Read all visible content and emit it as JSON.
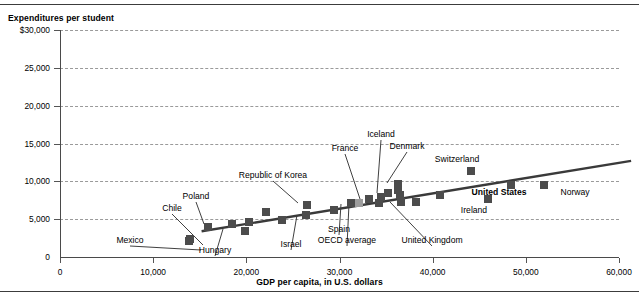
{
  "chart_data": {
    "type": "scatter",
    "title": "",
    "ylabel": "Expenditures per student",
    "xlabel": "GDP per capita, in U.S. dollars",
    "xlim": [
      0,
      60000
    ],
    "ylim": [
      0,
      30000
    ],
    "grid": true,
    "legend": "none",
    "y_ticks": [
      "$30,000",
      "25,000",
      "20,000",
      "15,000",
      "10,000",
      "5,000",
      "0"
    ],
    "y_tick_values": [
      30000,
      25000,
      20000,
      15000,
      10000,
      5000,
      0
    ],
    "x_ticks": [
      "0",
      "10,000",
      "20,000",
      "30,000",
      "40,000",
      "50,000",
      "60,000"
    ],
    "x_tick_values": [
      0,
      10000,
      20000,
      30000,
      40000,
      50000,
      60000
    ],
    "points": [
      {
        "label": "Mexico",
        "x": 13800,
        "y": 2100,
        "labeled": true,
        "bold": false,
        "shade": "dark"
      },
      {
        "label": "Chile",
        "x": 13900,
        "y": 2400,
        "labeled": true,
        "bold": false,
        "shade": "dark"
      },
      {
        "label": "Poland",
        "x": 15900,
        "y": 3900,
        "labeled": true,
        "bold": false,
        "shade": "dark"
      },
      {
        "label": "Hungary",
        "x": 18500,
        "y": 4400,
        "labeled": true,
        "bold": false,
        "shade": "dark"
      },
      {
        "label": "",
        "x": 19900,
        "y": 3400,
        "labeled": false,
        "bold": false,
        "shade": "dark"
      },
      {
        "label": "",
        "x": 20300,
        "y": 4600,
        "labeled": false,
        "bold": false,
        "shade": "dark"
      },
      {
        "label": "",
        "x": 22100,
        "y": 5900,
        "labeled": false,
        "bold": false,
        "shade": "dark"
      },
      {
        "label": "",
        "x": 23800,
        "y": 4900,
        "labeled": false,
        "bold": false,
        "shade": "dark"
      },
      {
        "label": "Republic of Korea",
        "x": 26500,
        "y": 6900,
        "labeled": true,
        "bold": false,
        "shade": "dark"
      },
      {
        "label": "Israel",
        "x": 26400,
        "y": 5500,
        "labeled": true,
        "bold": false,
        "shade": "dark"
      },
      {
        "label": "",
        "x": 29400,
        "y": 6200,
        "labeled": false,
        "bold": false,
        "shade": "dark"
      },
      {
        "label": "Spain",
        "x": 31200,
        "y": 7100,
        "labeled": true,
        "bold": false,
        "shade": "dark"
      },
      {
        "label": "OECD average",
        "x": 32100,
        "y": 7100,
        "labeled": true,
        "bold": false,
        "shade": "light"
      },
      {
        "label": "France",
        "x": 33200,
        "y": 7700,
        "labeled": true,
        "bold": false,
        "shade": "dark"
      },
      {
        "label": "",
        "x": 34200,
        "y": 7100,
        "labeled": false,
        "bold": false,
        "shade": "dark"
      },
      {
        "label": "",
        "x": 34500,
        "y": 7900,
        "labeled": false,
        "bold": false,
        "shade": "dark"
      },
      {
        "label": "Iceland",
        "x": 35200,
        "y": 8400,
        "labeled": true,
        "bold": false,
        "shade": "dark"
      },
      {
        "label": "Denmark",
        "x": 36300,
        "y": 9700,
        "labeled": true,
        "bold": false,
        "shade": "dark"
      },
      {
        "label": "",
        "x": 36300,
        "y": 8800,
        "labeled": false,
        "bold": false,
        "shade": "dark"
      },
      {
        "label": "",
        "x": 36500,
        "y": 8200,
        "labeled": false,
        "bold": false,
        "shade": "dark"
      },
      {
        "label": "United Kingdom",
        "x": 36600,
        "y": 7300,
        "labeled": true,
        "bold": false,
        "shade": "dark"
      },
      {
        "label": "",
        "x": 38200,
        "y": 7300,
        "labeled": false,
        "bold": false,
        "shade": "dark"
      },
      {
        "label": "",
        "x": 40800,
        "y": 8200,
        "labeled": false,
        "bold": false,
        "shade": "dark"
      },
      {
        "label": "Switzerland",
        "x": 44100,
        "y": 11300,
        "labeled": true,
        "bold": false,
        "shade": "dark"
      },
      {
        "label": "Ireland",
        "x": 45900,
        "y": 7600,
        "labeled": true,
        "bold": false,
        "shade": "dark"
      },
      {
        "label": "United States",
        "x": 48400,
        "y": 9500,
        "labeled": true,
        "bold": true,
        "shade": "dark"
      },
      {
        "label": "Norway",
        "x": 51900,
        "y": 9500,
        "labeled": true,
        "bold": false,
        "shade": "dark"
      }
    ],
    "trendline": {
      "x_start": 15200,
      "y_start": 3400,
      "x_end": 61300,
      "y_end": 12700
    },
    "annotations": [
      {
        "label": "Mexico",
        "text_x": 130,
        "text_y": 240,
        "leader_to_x": 201,
        "leader_to_y": 250
      },
      {
        "label": "Chile",
        "text_x": 172,
        "text_y": 208,
        "leader_to_x": 203,
        "leader_to_y": 245
      },
      {
        "label": "Poland",
        "text_x": 196,
        "text_y": 196,
        "leader_to_x": 204,
        "leader_to_y": 224
      },
      {
        "label": "Hungary",
        "text_x": 215,
        "text_y": 250,
        "leader_to_x": 223,
        "leader_to_y": 229
      },
      {
        "label": "Republic of Korea",
        "text_x": 273,
        "text_y": 175,
        "leader_to_x": 298,
        "leader_to_y": 203
      },
      {
        "label": "Israel",
        "text_x": 291,
        "text_y": 244,
        "leader_to_x": 297,
        "leader_to_y": 215
      },
      {
        "label": "Spain",
        "text_x": 339,
        "text_y": 229,
        "leader_to_x": 341,
        "leader_to_y": 204
      },
      {
        "label": "OECD average",
        "text_x": 347,
        "text_y": 240,
        "leader_to_x": 349,
        "leader_to_y": 204
      },
      {
        "label": "France",
        "text_x": 345,
        "text_y": 148,
        "leader_to_x": 360,
        "leader_to_y": 199
      },
      {
        "label": "Iceland",
        "text_x": 381,
        "text_y": 134,
        "leader_to_x": 377,
        "leader_to_y": 193
      },
      {
        "label": "Denmark",
        "text_x": 407,
        "text_y": 146,
        "leader_to_x": 387,
        "leader_to_y": 183
      },
      {
        "label": "United Kingdom",
        "text_x": 432,
        "text_y": 240,
        "leader_to_x": 390,
        "leader_to_y": 202
      },
      {
        "label": "Switzerland",
        "text_x": 457,
        "text_y": 159,
        "leader_to_x": 0,
        "leader_to_y": 0
      },
      {
        "label": "United States",
        "text_x": 499,
        "text_y": 192,
        "leader_to_x": 0,
        "leader_to_y": 0
      },
      {
        "label": "Ireland",
        "text_x": 474,
        "text_y": 210,
        "leader_to_x": 0,
        "leader_to_y": 0
      },
      {
        "label": "Norway",
        "text_x": 575,
        "text_y": 192,
        "leader_to_x": 0,
        "leader_to_y": 0
      }
    ]
  }
}
